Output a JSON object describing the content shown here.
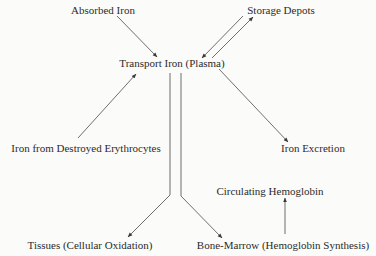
{
  "diagram": {
    "type": "flow",
    "nodes": {
      "absorbed_iron": {
        "label": "Absorbed Iron",
        "x": 103,
        "y": 4
      },
      "storage_depots": {
        "label": "Storage Depots",
        "x": 281,
        "y": 4
      },
      "transport_iron": {
        "label": "Transport Iron (Plasma)",
        "x": 172,
        "y": 57
      },
      "destroyed_erythrocytes": {
        "label": "Iron from Destroyed Erythrocytes",
        "x": 86,
        "y": 142
      },
      "iron_excretion": {
        "label": "Iron Excretion",
        "x": 313,
        "y": 142
      },
      "circulating_hemoglobin": {
        "label": "Circulating Hemoglobin",
        "x": 270,
        "y": 185
      },
      "tissues": {
        "label": "Tissues (Cellular Oxidation)",
        "x": 90,
        "y": 239
      },
      "bone_marrow": {
        "label": "Bone-Marrow (Hemoglobin Synthesis)",
        "x": 283,
        "y": 239
      }
    },
    "edges": [
      {
        "from": "Absorbed Iron",
        "to": "Transport Iron (Plasma)"
      },
      {
        "from": "Storage Depots",
        "to": "Transport Iron (Plasma)"
      },
      {
        "from": "Transport Iron (Plasma)",
        "to": "Storage Depots"
      },
      {
        "from": "Iron from Destroyed Erythrocytes",
        "to": "Transport Iron (Plasma)"
      },
      {
        "from": "Transport Iron (Plasma)",
        "to": "Iron Excretion"
      },
      {
        "from": "Transport Iron (Plasma)",
        "to": "Tissues (Cellular Oxidation)"
      },
      {
        "from": "Transport Iron (Plasma)",
        "to": "Bone-Marrow (Hemoglobin Synthesis)"
      },
      {
        "from": "Bone-Marrow (Hemoglobin Synthesis)",
        "to": "Circulating Hemoglobin"
      }
    ],
    "colors": {
      "line": "#3a3a3a",
      "text": "#2b2b2b",
      "background": "#fbfbf9"
    }
  }
}
